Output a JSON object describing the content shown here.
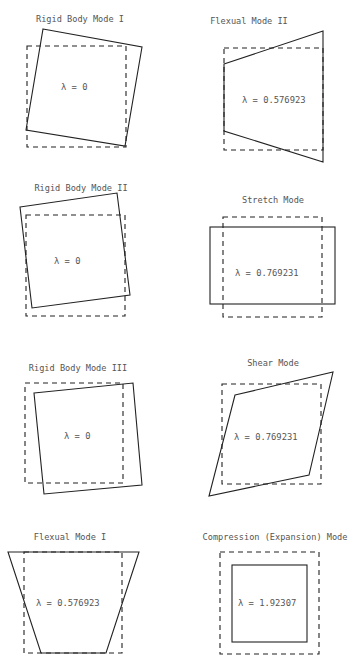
{
  "panels": [
    {
      "title": "Rigid Body Mode I",
      "lambda": "λ = 0"
    },
    {
      "title": "Flexual Mode II",
      "lambda": "λ = 0.576923"
    },
    {
      "title": "Rigid Body Mode II",
      "lambda": "λ = 0"
    },
    {
      "title": "Stretch Mode",
      "lambda": "λ = 0.769231"
    },
    {
      "title": "Rigid Body Mode III",
      "lambda": "λ = 0"
    },
    {
      "title": "Shear Mode",
      "lambda": "λ = 0.769231"
    },
    {
      "title": "Flexual Mode I",
      "lambda": "λ = 0.576923"
    },
    {
      "title": "Compression (Expansion) Mode",
      "lambda": "λ = 1.92307"
    }
  ]
}
